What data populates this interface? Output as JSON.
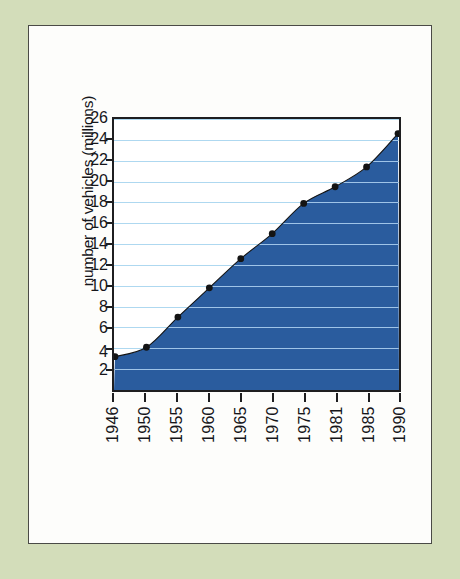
{
  "figure": {
    "background_color": "#d3ddba",
    "panel_color": "#fdfdfb",
    "panel_border_color": "#4a4a46"
  },
  "chart_data": {
    "type": "area",
    "title": "",
    "subtitle": "",
    "xlabel": "",
    "ylabel": "number of vehicles (millions)",
    "categories": [
      "1946",
      "1950",
      "1955",
      "1960",
      "1965",
      "1970",
      "1975",
      "1981",
      "1985",
      "1990"
    ],
    "x": [
      1946,
      1950,
      1955,
      1960,
      1965,
      1970,
      1975,
      1981,
      1985,
      1990
    ],
    "values": [
      3.2,
      4.1,
      7.0,
      9.8,
      12.6,
      15.0,
      17.9,
      19.5,
      21.4,
      24.6
    ],
    "series": [
      {
        "name": "number of vehicles (millions)",
        "values": [
          3.2,
          4.1,
          7.0,
          9.8,
          12.6,
          15.0,
          17.9,
          19.5,
          21.4,
          24.6
        ]
      }
    ],
    "ylim": [
      0,
      26
    ],
    "xlim": [
      1946,
      1990
    ],
    "ytick_labels": [
      "2",
      "4",
      "6",
      "8",
      "10",
      "12",
      "14",
      "16",
      "18",
      "20",
      "22",
      "24",
      "26"
    ],
    "ytick_values": [
      2,
      4,
      6,
      8,
      10,
      12,
      14,
      16,
      18,
      20,
      22,
      24,
      26
    ],
    "xtick_labels": [
      "1946",
      "1950",
      "1955",
      "1960",
      "1965",
      "1970",
      "1975",
      "1981",
      "1985",
      "1990"
    ],
    "grid": true,
    "grid_axis": "y",
    "grid_color": "#aed8f0",
    "legend": false,
    "legend_position": "none",
    "fill_color": "#2a5c9e",
    "marker_color": "#141414",
    "marker_style": "circle",
    "line_color": "#141414",
    "axis_color": "#1e1e20"
  }
}
